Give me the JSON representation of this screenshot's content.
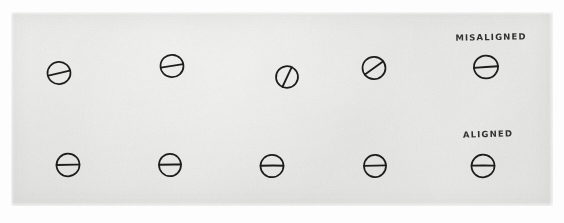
{
  "scene": {
    "width": 564,
    "height": 223,
    "background_color": "#fdfdfd",
    "medium": "photograph of hand-drawn sketch on paper"
  },
  "paper": {
    "color": "#e5e5e3",
    "left": 11,
    "top": 12,
    "width": 542,
    "height": 194
  },
  "ink_color": "#1d1d1d",
  "annotations": [
    {
      "name": "label-misaligned",
      "text": "MISALIGNED",
      "x": 491,
      "y": 37,
      "describes_row": "top"
    },
    {
      "name": "label-aligned",
      "text": "ALIGNED",
      "x": 488,
      "y": 134,
      "describes_row": "bottom"
    }
  ],
  "rows": [
    {
      "name": "misaligned-row",
      "label": "MISALIGNED",
      "symbols": [
        {
          "name": "circle-slash-1",
          "cx": 59,
          "cy": 73,
          "r": 11.5,
          "angle_deg": -22,
          "state": "misaligned"
        },
        {
          "name": "circle-slash-2",
          "cx": 172,
          "cy": 66,
          "r": 11.5,
          "angle_deg": -13,
          "state": "misaligned"
        },
        {
          "name": "circle-slash-3",
          "cx": 287,
          "cy": 77,
          "r": 11.0,
          "angle_deg": -68,
          "state": "misaligned"
        },
        {
          "name": "circle-slash-4",
          "cx": 374,
          "cy": 68,
          "r": 11.5,
          "angle_deg": -36,
          "state": "misaligned"
        },
        {
          "name": "circle-slash-5",
          "cx": 486,
          "cy": 67,
          "r": 12.0,
          "angle_deg": -4,
          "state": "misaligned"
        }
      ]
    },
    {
      "name": "aligned-row",
      "label": "ALIGNED",
      "symbols": [
        {
          "name": "circle-bar-1",
          "cx": 68,
          "cy": 165,
          "r": 11.5,
          "angle_deg": 0,
          "state": "aligned"
        },
        {
          "name": "circle-bar-2",
          "cx": 170,
          "cy": 165,
          "r": 11.0,
          "angle_deg": 0,
          "state": "aligned"
        },
        {
          "name": "circle-bar-3",
          "cx": 272,
          "cy": 166,
          "r": 11.5,
          "angle_deg": 0,
          "state": "aligned"
        },
        {
          "name": "circle-bar-4",
          "cx": 375,
          "cy": 166,
          "r": 11.0,
          "angle_deg": 0,
          "state": "aligned"
        },
        {
          "name": "circle-bar-5",
          "cx": 483,
          "cy": 166,
          "r": 11.5,
          "angle_deg": 0,
          "state": "aligned"
        }
      ]
    }
  ]
}
